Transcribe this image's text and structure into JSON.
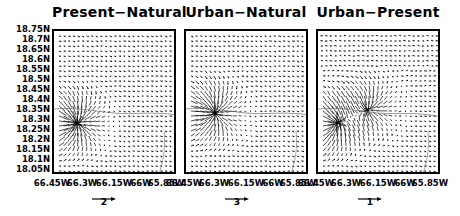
{
  "chart_data": [
    {
      "type": "vector_field",
      "title": "Present−Natural",
      "xlabel": "",
      "ylabel": "",
      "xticks": [
        "66.45W",
        "66.3W",
        "66.15W",
        "66W",
        "65.85W"
      ],
      "yticks": [
        "18.75N",
        "18.7N",
        "18.65N",
        "18.6N",
        "18.55N",
        "18.5N",
        "18.45N",
        "18.4N",
        "18.35N",
        "18.3N",
        "18.25N",
        "18.2N",
        "18.15N",
        "18.1N",
        "18.05N"
      ],
      "xlim": [
        "66.5W",
        "65.75W"
      ],
      "ylim": [
        "18.05N",
        "18.77N"
      ],
      "reference_vector": 2,
      "notes": "Strong southwest-directed arrows converging near 66.4W,18.3N; coastline contour near 18.45N"
    },
    {
      "type": "vector_field",
      "title": "Urban−Natural",
      "xticks": [
        "66.45W",
        "66.3W",
        "66.15W",
        "66W",
        "65.85W"
      ],
      "yticks": [],
      "reference_vector": 3,
      "notes": "Similar pattern, converging vectors near 66.35W,18.32N"
    },
    {
      "type": "vector_field",
      "title": "Urban−Present",
      "xticks": [
        "66.45W",
        "66.3W",
        "66.15W",
        "66W",
        "65.85W"
      ],
      "yticks": [],
      "reference_vector": 1,
      "notes": "Radiating/convergent vector cluster near 66.4W,18.3N and 66.25W,18.4N"
    }
  ],
  "panels": [
    {
      "title": "Present−Natural",
      "ref": "2"
    },
    {
      "title": "Urban−Natural",
      "ref": "3"
    },
    {
      "title": "Urban−Present",
      "ref": "1"
    }
  ],
  "yticks": [
    "18.75N",
    "18.7N",
    "18.65N",
    "18.6N",
    "18.55N",
    "18.5N",
    "18.45N",
    "18.4N",
    "18.35N",
    "18.3N",
    "18.25N",
    "18.2N",
    "18.15N",
    "18.1N",
    "18.05N"
  ],
  "xticks": [
    "66.45W",
    "66.3W",
    "66.15W",
    "66W",
    "65.85W"
  ]
}
